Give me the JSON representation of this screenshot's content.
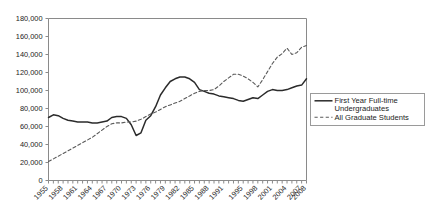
{
  "chart_data": {
    "type": "line",
    "title": "",
    "subtitle": "",
    "xlabel": "",
    "ylabel": "",
    "grid": false,
    "legend_position": "right",
    "xlim": [
      1955,
      2008
    ],
    "ylim": [
      0,
      180000
    ],
    "y_ticks": [
      0,
      20000,
      40000,
      60000,
      80000,
      100000,
      120000,
      140000,
      160000,
      180000
    ],
    "y_tick_labels": [
      "0",
      "20,000",
      "40,000",
      "60,000",
      "80,000",
      "100,000",
      "120,000",
      "140,000",
      "160,000",
      "180,000"
    ],
    "x_tick_labels": [
      "1955",
      "1958",
      "1961",
      "1964",
      "1967",
      "1970",
      "1973",
      "1976",
      "1979",
      "1982",
      "1985",
      "1988",
      "1991",
      "1995",
      "1998",
      "2001",
      "2004",
      "2007",
      "2008"
    ],
    "x": [
      1955,
      1956,
      1957,
      1958,
      1959,
      1960,
      1961,
      1962,
      1963,
      1964,
      1965,
      1966,
      1967,
      1968,
      1969,
      1970,
      1971,
      1972,
      1973,
      1974,
      1975,
      1976,
      1977,
      1978,
      1979,
      1980,
      1981,
      1982,
      1983,
      1984,
      1985,
      1986,
      1987,
      1988,
      1989,
      1990,
      1991,
      1992,
      1993,
      1994,
      1995,
      1996,
      1997,
      1998,
      1999,
      2000,
      2001,
      2002,
      2003,
      2004,
      2005,
      2006,
      2007,
      2008
    ],
    "series": [
      {
        "name": "First Year Full-time Undergraduates",
        "style": "solid",
        "color": "#2b2b2b",
        "values": [
          70000,
          73000,
          72000,
          69000,
          67000,
          66000,
          65000,
          65000,
          65000,
          64000,
          64000,
          65000,
          66000,
          70000,
          71000,
          71000,
          69000,
          62000,
          50000,
          53000,
          67000,
          72000,
          82000,
          95000,
          103000,
          110000,
          113000,
          115000,
          115000,
          113000,
          109000,
          101000,
          99000,
          97000,
          96000,
          94000,
          93000,
          92000,
          91000,
          89000,
          88000,
          90000,
          92000,
          91000,
          95000,
          99000,
          101000,
          100000,
          100000,
          101000,
          103000,
          105000,
          106000,
          113000
        ]
      },
      {
        "name": "All Graduate Students",
        "style": "dashed",
        "color": "#5a5a5a",
        "values": [
          21000,
          24000,
          27000,
          30000,
          33000,
          36000,
          39000,
          42000,
          45000,
          48000,
          52000,
          56000,
          60000,
          63000,
          64000,
          64000,
          65000,
          65000,
          66000,
          68000,
          71000,
          74000,
          76000,
          79000,
          82000,
          84000,
          86000,
          88000,
          91000,
          94000,
          97000,
          99000,
          100000,
          100000,
          101000,
          105000,
          110000,
          114000,
          118000,
          118000,
          116000,
          113000,
          109000,
          104000,
          112000,
          121000,
          130000,
          137000,
          141000,
          147000,
          140000,
          142000,
          148000,
          150000
        ]
      }
    ]
  },
  "legend": {
    "items": [
      {
        "label_line1": "First Year Full-time",
        "label_line2": "Undergraduates",
        "style": "solid"
      },
      {
        "label_line1": "All Graduate Students",
        "label_line2": "",
        "style": "dashed"
      }
    ]
  },
  "colors": {
    "axis": "#8a8a8a",
    "text": "#1c1c1c",
    "series_solid": "#2b2b2b",
    "series_dashed": "#5a5a5a",
    "legend_border": "#9a9a9a",
    "background": "#ffffff"
  }
}
